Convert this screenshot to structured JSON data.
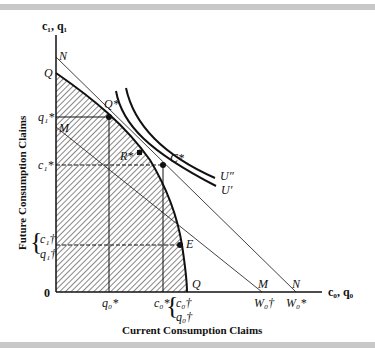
{
  "figure": {
    "x_axis_title": "Current Consumption Claims",
    "y_axis_title": "Future Consumption Claims",
    "x_axis_var": "c₀, q₀",
    "y_axis_var": "c₁, q₁",
    "origin_label": "0"
  },
  "y_axis_labels": {
    "N": "N",
    "Q": "Q",
    "q1_star": "q₁*",
    "M": "M",
    "c1_star": "c₁*",
    "c1_dagger": "c₁†",
    "q1_dagger": "q₁†"
  },
  "x_axis_labels": {
    "q0_star": "q₀*",
    "c0_star": "c₀*",
    "c0_dagger": "c₀†",
    "q0_dagger": "q₀†",
    "W0_dagger": "W₀†",
    "W0_star": "W₀*",
    "Q": "Q",
    "M": "M",
    "N": "N"
  },
  "points": {
    "Q_star": "Q*",
    "R_star": "R*",
    "C_star": "C*",
    "E": "E"
  },
  "curves": {
    "U_double_prime": "U″",
    "U_prime": "U′"
  },
  "colors": {
    "ink": "#111111",
    "rule": "#c8c8c8",
    "background": "#ffffff"
  }
}
